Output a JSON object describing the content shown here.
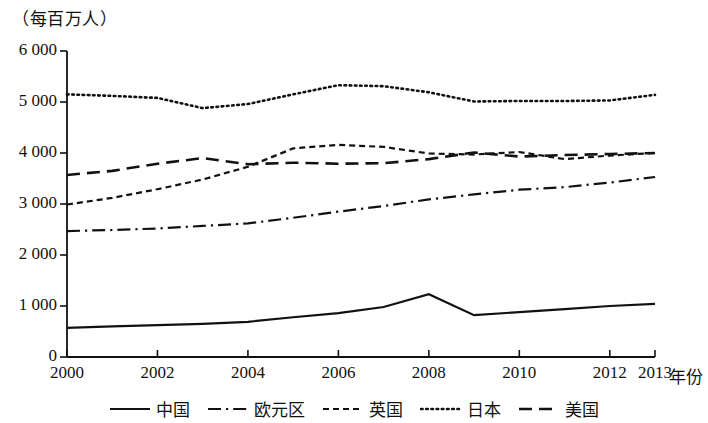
{
  "chart_data": {
    "type": "line",
    "title": "",
    "subtitle": "",
    "unit_label": "（每百万人）",
    "xlabel": "年份",
    "ylabel": "",
    "x": [
      2000,
      2001,
      2002,
      2003,
      2004,
      2005,
      2006,
      2007,
      2008,
      2009,
      2010,
      2011,
      2012,
      2013
    ],
    "xtick_labels": [
      "2000",
      "2002",
      "2004",
      "2006",
      "2008",
      "2010",
      "2012",
      "2013"
    ],
    "xticks": [
      2000,
      2002,
      2004,
      2006,
      2008,
      2010,
      2012,
      2013
    ],
    "ytick_labels": [
      "0",
      "1 000",
      "2 000",
      "3 000",
      "4 000",
      "5 000",
      "6 000"
    ],
    "yticks": [
      0,
      1000,
      2000,
      3000,
      4000,
      5000,
      6000
    ],
    "ylim": [
      0,
      6000
    ],
    "xlim": [
      2000,
      2013
    ],
    "grid": false,
    "legend_position": "bottom",
    "series": [
      {
        "name": "中国",
        "style": "solid",
        "color": "#111111",
        "values": [
          570,
          600,
          625,
          650,
          690,
          780,
          860,
          980,
          1230,
          820,
          880,
          940,
          1000,
          1040
        ]
      },
      {
        "name": "欧元区",
        "style": "dashdot",
        "color": "#111111",
        "values": [
          2470,
          2490,
          2520,
          2570,
          2620,
          2730,
          2850,
          2960,
          3090,
          3190,
          3280,
          3330,
          3420,
          3530
        ]
      },
      {
        "name": "英国",
        "style": "dashed-short",
        "color": "#111111",
        "values": [
          2990,
          3120,
          3290,
          3480,
          3730,
          4090,
          4160,
          4120,
          3990,
          3970,
          4020,
          3880,
          3950,
          4000
        ]
      },
      {
        "name": "日本",
        "style": "dotted",
        "color": "#111111",
        "values": [
          5150,
          5120,
          5080,
          4880,
          4960,
          5150,
          5330,
          5310,
          5190,
          5010,
          5020,
          5020,
          5030,
          5140
        ]
      },
      {
        "name": "美国",
        "style": "dashed-long",
        "color": "#111111",
        "values": [
          3570,
          3650,
          3790,
          3900,
          3780,
          3810,
          3790,
          3800,
          3880,
          4010,
          3930,
          3960,
          3980,
          4000
        ]
      }
    ]
  },
  "legend": {
    "items": [
      {
        "label": "中国",
        "style": "solid"
      },
      {
        "label": "欧元区",
        "style": "dashdot"
      },
      {
        "label": "英国",
        "style": "dashed-short"
      },
      {
        "label": "日本",
        "style": "dotted"
      },
      {
        "label": "美国",
        "style": "dashed-long"
      }
    ]
  }
}
